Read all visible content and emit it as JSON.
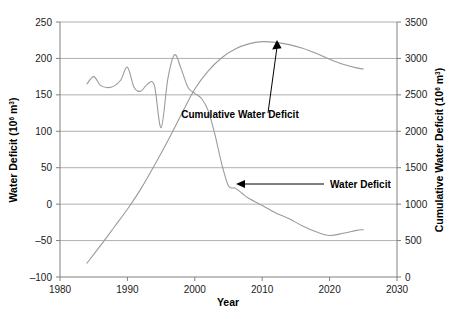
{
  "chart_data": {
    "type": "line",
    "title": "",
    "xlabel": "Year",
    "ylabel": "Water Deficit (10^6 m^3)",
    "y2label": "Cumulative Water Deficit (10^6 m^3)",
    "xlim": [
      1980,
      2030
    ],
    "ylim": [
      -100,
      250
    ],
    "y2lim": [
      0,
      3500
    ],
    "xticks": [
      1980,
      1990,
      2000,
      2010,
      2020,
      2030
    ],
    "yticks": [
      -100,
      -50,
      0,
      50,
      100,
      150,
      200,
      250
    ],
    "y2ticks": [
      0,
      500,
      1000,
      1500,
      2000,
      2500,
      3000,
      3500
    ],
    "grid": "horizontal",
    "legend": "none (inline annotations with arrows)",
    "series": [
      {
        "name": "Water Deficit",
        "axis": "left",
        "color": "#9b9b9b",
        "x": [
          1984,
          1985,
          1986,
          1987,
          1988,
          1989,
          1990,
          1991,
          1992,
          1993,
          1994,
          1995,
          1996,
          1997,
          1998,
          1999,
          2000,
          2001,
          2002,
          2003,
          2004,
          2005,
          2006,
          2007,
          2008,
          2010,
          2012,
          2014,
          2016,
          2018,
          2020,
          2022,
          2024,
          2025
        ],
        "values": [
          165,
          175,
          163,
          160,
          162,
          170,
          188,
          160,
          155,
          165,
          163,
          105,
          172,
          205,
          185,
          160,
          152,
          145,
          128,
          95,
          55,
          25,
          22,
          15,
          8,
          -2,
          -12,
          -20,
          -30,
          -38,
          -43,
          -40,
          -36,
          -35
        ]
      },
      {
        "name": "Cumulative Water Deficit",
        "axis": "right",
        "color": "#9b9b9b",
        "x": [
          1984,
          1986,
          1988,
          1990,
          1992,
          1994,
          1996,
          1998,
          2000,
          2002,
          2004,
          2006,
          2008,
          2010,
          2012,
          2014,
          2016,
          2018,
          2020,
          2022,
          2024,
          2025
        ],
        "values": [
          190,
          430,
          680,
          930,
          1210,
          1530,
          1870,
          2230,
          2580,
          2830,
          3010,
          3130,
          3200,
          3230,
          3220,
          3190,
          3140,
          3070,
          2990,
          2920,
          2870,
          2855
        ]
      }
    ],
    "annotations": [
      {
        "name": "cumulative-water-deficit-annotation",
        "text": "Cumulative Water Deficit",
        "points_to_series": "Cumulative Water Deficit",
        "points_to_x": 2009,
        "points_to_y": 3230
      },
      {
        "name": "water-deficit-annotation",
        "text": "Water Deficit",
        "points_to_series": "Water Deficit",
        "points_to_x": 2006,
        "points_to_y": 22
      }
    ]
  },
  "axes": {
    "x_title": "Year",
    "y_left_title_main": "Water Deficit (10",
    "y_left_title_sup": "6",
    "y_left_title_tail": " m",
    "y_left_title_sup2": "3",
    "y_left_title_end": ")",
    "y_right_title_main": "Cumulative Water Deficit (10",
    "y_right_title_sup": "6",
    "y_right_title_tail": " m",
    "y_right_title_sup2": "3",
    "y_right_title_end": ")",
    "x_tick_labels": [
      "1980",
      "1990",
      "2000",
      "2010",
      "2020",
      "2030"
    ],
    "y_left_tick_labels": [
      "250",
      "200",
      "150",
      "100",
      "50",
      "0",
      "–50",
      "–100"
    ],
    "y_right_tick_labels": [
      "3500",
      "3000",
      "2500",
      "2000",
      "1500",
      "1000",
      "500",
      "0"
    ]
  },
  "annotations": {
    "cumulative_label": "Cumulative Water Deficit",
    "water_deficit_label": "Water Deficit"
  },
  "colors": {
    "series": "#9b9b9b",
    "grid": "#9a9a9a",
    "axis": "#808080",
    "text": "#000000",
    "background": "#ffffff"
  }
}
